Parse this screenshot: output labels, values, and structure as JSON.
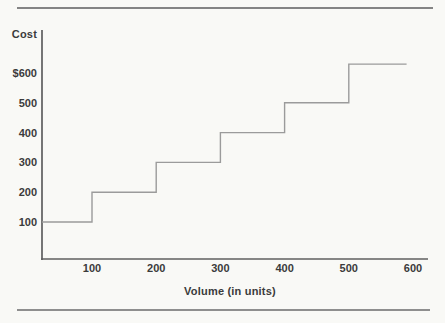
{
  "chart_data": {
    "type": "line",
    "line_shape": "step",
    "title": "",
    "xlabel": "Volume (in units)",
    "ylabel": "Cost",
    "x_ticks": [
      100,
      200,
      300,
      400,
      500,
      600
    ],
    "y_tick_labels": [
      "$600",
      "500",
      "400",
      "300",
      "200",
      "100"
    ],
    "y_tick_values": [
      600,
      500,
      400,
      300,
      200,
      100
    ],
    "xlim": [
      0,
      620
    ],
    "ylim": [
      0,
      750
    ],
    "grid": false,
    "legend": "none",
    "series": [
      {
        "name": "step-cost",
        "steps": [
          {
            "from": 0,
            "to": 100,
            "cost": 100
          },
          {
            "from": 100,
            "to": 200,
            "cost": 200
          },
          {
            "from": 200,
            "to": 300,
            "cost": 300
          },
          {
            "from": 300,
            "to": 400,
            "cost": 400
          },
          {
            "from": 400,
            "to": 500,
            "cost": 500
          },
          {
            "from": 500,
            "to": 590,
            "cost": 630
          }
        ]
      }
    ],
    "colors": {
      "axis": "#5f5f5f",
      "line": "#9b9b9b",
      "text": "#3b3b3b",
      "background": "#f9f9f6"
    }
  }
}
